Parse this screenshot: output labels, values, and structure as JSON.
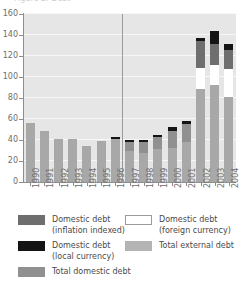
{
  "title_clipped": "Figure 2.  Debt",
  "chart_data": {
    "type": "bar",
    "subtype": "stacked-bar",
    "title": "",
    "xlabel": "",
    "ylabel": "",
    "ylim": [
      0,
      160
    ],
    "ytick_step": 20,
    "yticks": [
      "0",
      "20",
      "40",
      "60",
      "80",
      "100",
      "120",
      "140",
      "160"
    ],
    "grid": true,
    "grid_orientation": "horizontal",
    "legend_position": "below",
    "annotations": [
      {
        "type": "vertical-divider",
        "after_category": "1996"
      }
    ],
    "categories": [
      "1990",
      "1991",
      "1992",
      "1993",
      "1994",
      "1995",
      "1996",
      "1997",
      "1998",
      "1999",
      "2000",
      "2001",
      "2002",
      "2003",
      "2004"
    ],
    "series": [
      {
        "name": "Total external debt",
        "key": "external",
        "color": "#a8a8a8",
        "values": [
          56,
          49,
          41,
          41,
          34,
          39,
          41,
          30,
          28,
          31,
          32,
          38,
          89,
          92,
          81
        ]
      },
      {
        "name": "Total domestic debt",
        "key": "domestic_total",
        "color": "#909090",
        "values": [
          0,
          0,
          0,
          0,
          0,
          0,
          0,
          8,
          10,
          12,
          17,
          17,
          0,
          0,
          0
        ]
      },
      {
        "name": "Domestic debt (foreign currency)",
        "key": "domestic_foreign",
        "color": "#ffffff",
        "values": [
          0,
          0,
          0,
          0,
          0,
          0,
          0,
          0,
          0,
          0,
          0,
          0,
          20,
          19,
          27
        ]
      },
      {
        "name": "Domestic debt (inflation indexed)",
        "key": "domestic_inflation",
        "color": "#6e6e6e",
        "values": [
          0,
          0,
          0,
          0,
          0,
          0,
          0,
          0,
          0,
          0,
          0,
          0,
          25,
          20,
          18
        ]
      },
      {
        "name": "Domestic debt (local currency)",
        "key": "domestic_local",
        "color": "#141414",
        "values": [
          0,
          0,
          0,
          0,
          0,
          0,
          2,
          2,
          2,
          2,
          3,
          3,
          3,
          13,
          5
        ]
      }
    ],
    "totals": [
      56,
      49,
      41,
      41,
      34,
      39,
      43,
      40,
      40,
      45,
      52,
      58,
      137,
      144,
      131
    ]
  },
  "legend": {
    "items": [
      {
        "swatch": "infl",
        "line1": "Domestic debt",
        "line2": "(inflation indexed)"
      },
      {
        "swatch": "loc",
        "line1": "Domestic debt",
        "line2": "(local currency)"
      },
      {
        "swatch": "dom",
        "line1": "Total domestic debt",
        "line2": ""
      },
      {
        "swatch": "forx",
        "line1": "Domestic debt",
        "line2": "(foreign currency)"
      },
      {
        "swatch": "ext",
        "line1": "Total external debt",
        "line2": ""
      }
    ]
  }
}
